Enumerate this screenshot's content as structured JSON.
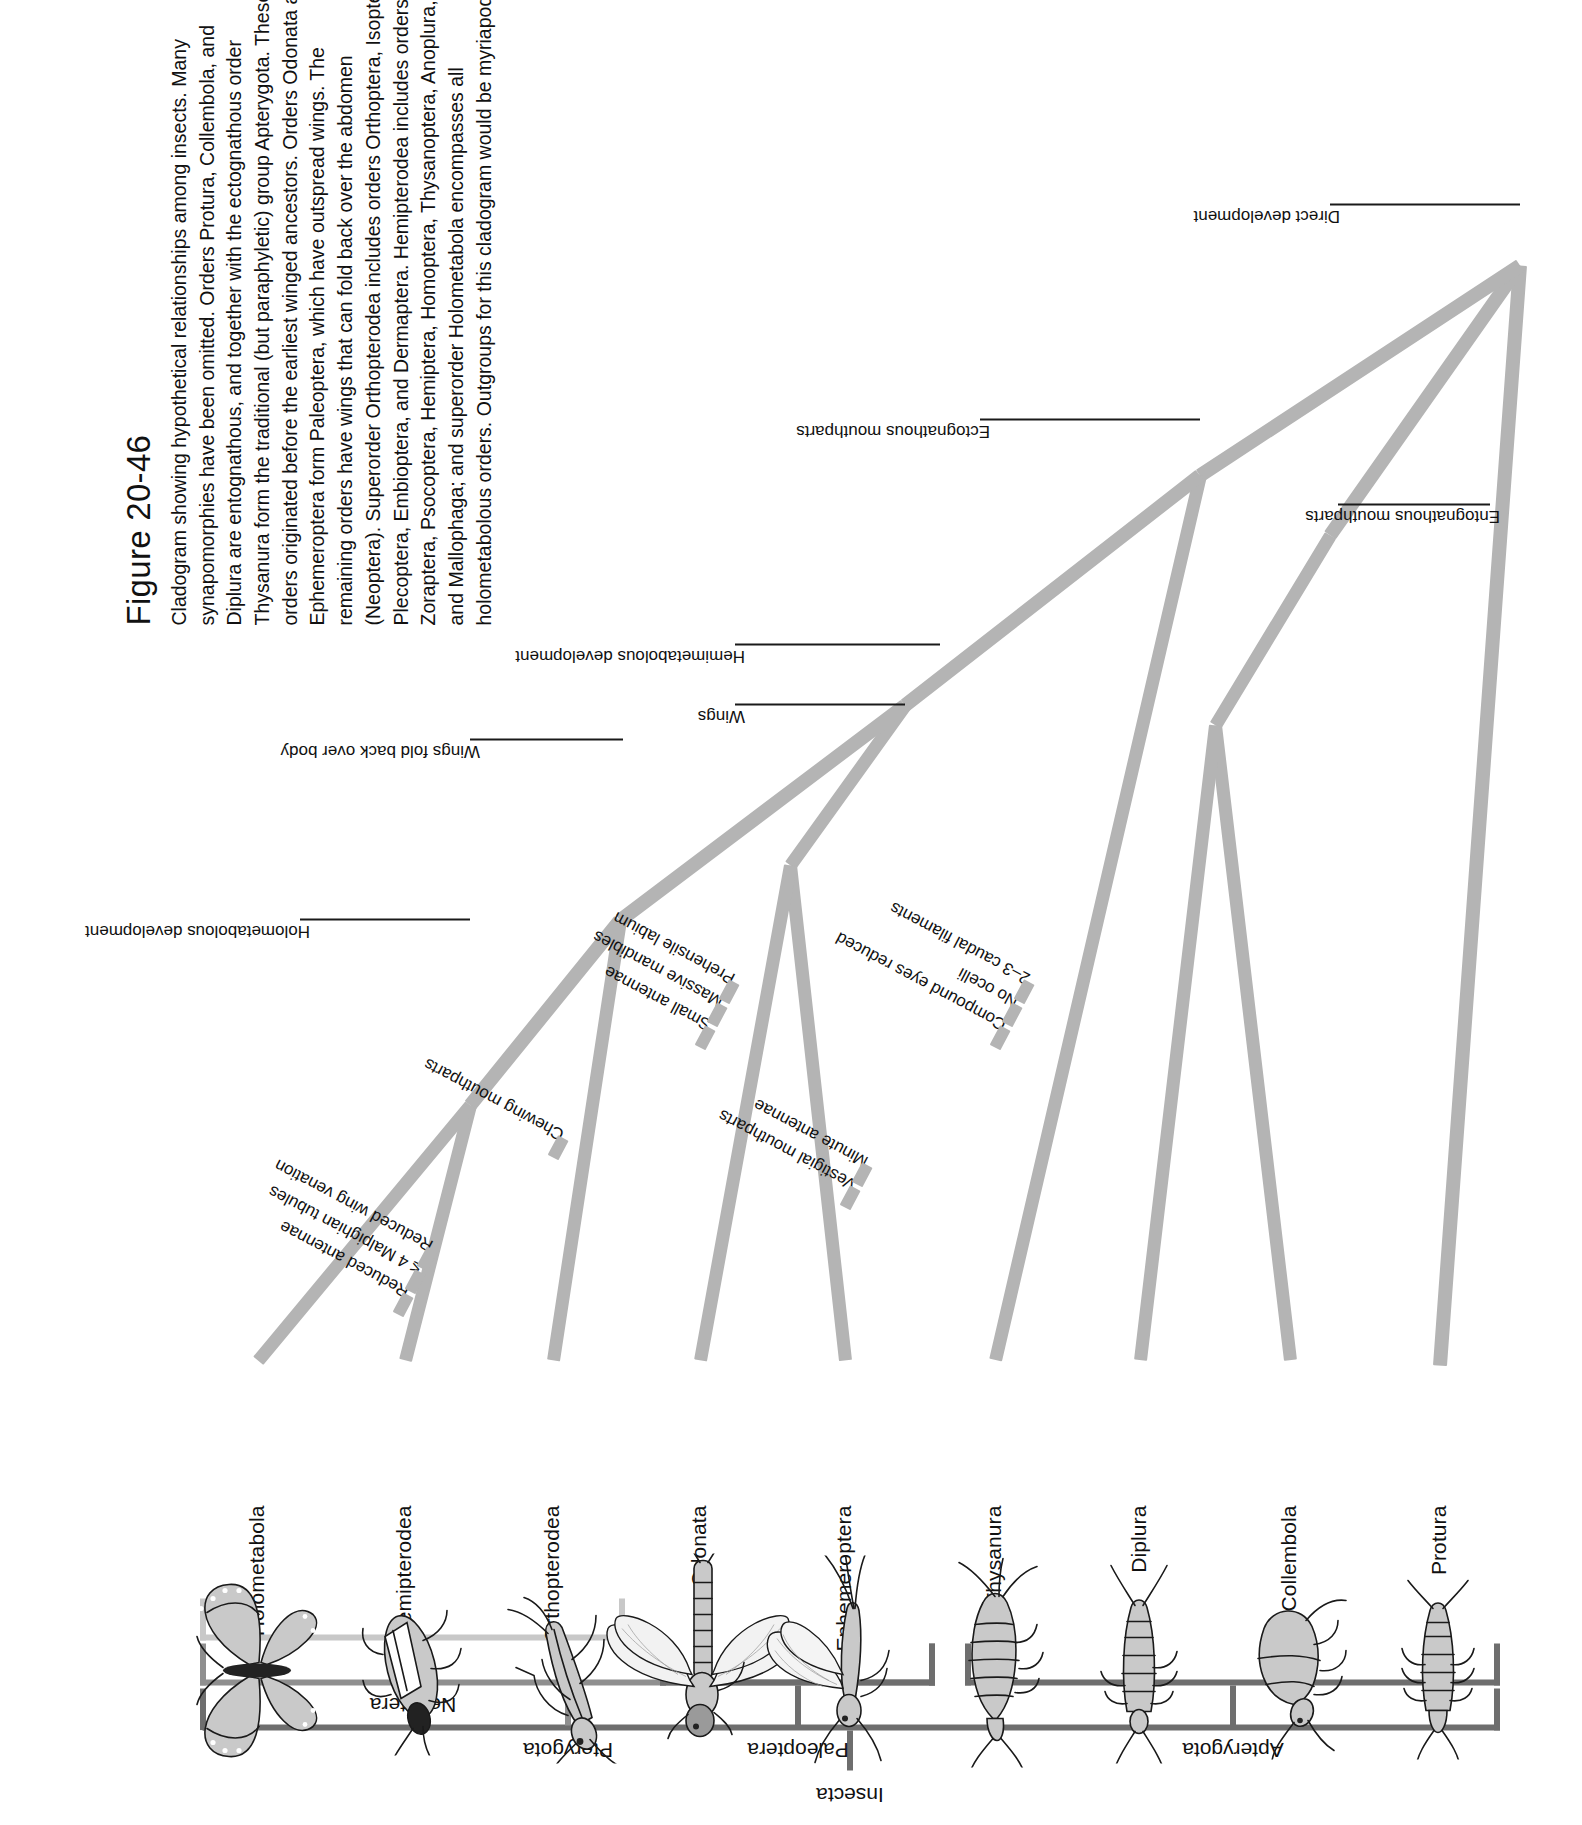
{
  "figure": {
    "number": "Figure 20-46",
    "caption": "Cladogram showing hypothetical relationships among insects. Many synapomorphies have been omitted. Orders Protura, Collembola, and Diplura are entognathous, and together with the ectognathous order Thysanura form the traditional (but paraphyletic) group Apterygota. These orders originated before the earliest winged ancestors. Orders Odonata and Ephemeroptera form Paleoptera, which have outspread wings. The remaining orders have wings that can fold back over the abdomen (Neoptera). Superorder Orthopterodea includes orders Orthoptera, Isoptera, Plecoptera, Embioptera, and Dermaptera. Hemipterodea includes orders Zoraptera, Psocoptera, Hemiptera, Homoptera, Thysanoptera, Anoplura, and Mallophaga; and superorder Holometabola encompasses all holometabolous orders. Outgroups for this cladogram would be myriapods."
  },
  "colors": {
    "branch": "#b4b4b4",
    "bracket_dark": "#6e6e6e",
    "bracket_mid": "#8f8f8f",
    "bracket_light": "#c8c8c8",
    "text": "#111111"
  },
  "chart_data": {
    "type": "diagram",
    "taxa": [
      {
        "id": "protura",
        "label": "Protura",
        "icon": "protura-drawing"
      },
      {
        "id": "collembola",
        "label": "Collembola",
        "icon": "collembola-drawing"
      },
      {
        "id": "diplura",
        "label": "Diplura",
        "icon": "diplura-drawing"
      },
      {
        "id": "thysanura",
        "label": "Thysanura",
        "icon": "thysanura-drawing"
      },
      {
        "id": "ephemeroptera",
        "label": "Ephemeroptera",
        "icon": "mayfly-drawing"
      },
      {
        "id": "odonata",
        "label": "Odonata",
        "icon": "dragonfly-drawing"
      },
      {
        "id": "orthopterodea",
        "label": "Orthopterodea",
        "icon": "mantis-drawing"
      },
      {
        "id": "hemipterodea",
        "label": "Hemipterodea",
        "icon": "truebug-drawing"
      },
      {
        "id": "holometabola",
        "label": "Holometabola",
        "icon": "butterfly-drawing"
      }
    ],
    "clade_brackets": [
      {
        "id": "insecta",
        "label": "Insecta",
        "shade": "dark"
      },
      {
        "id": "pterygota",
        "label": "Pterygota",
        "shade": "mid"
      },
      {
        "id": "neoptera",
        "label": "Neoptera",
        "shade": "light"
      },
      {
        "id": "paleoptera",
        "label": "Paleoptera",
        "shade": "dark"
      },
      {
        "id": "apterygota",
        "label": "Apterygota",
        "shade": "dark"
      }
    ],
    "synapomorphy_stacks": [
      {
        "id": "hemipterodea-chars",
        "items": [
          "Reduced antennae",
          "≤ 4 Malpighian tubules",
          "Reduced wing venation"
        ]
      },
      {
        "id": "orthopterodea-chars",
        "items": [
          "Chewing mouthparts"
        ]
      },
      {
        "id": "odonata-chars",
        "items": [
          "Small antennae",
          "Massive mandibles",
          "Prehensile labium"
        ]
      },
      {
        "id": "ephemeroptera-chars",
        "items": [
          "Vestigial mouthparts",
          "Minute antennae"
        ]
      },
      {
        "id": "thysanura-chars",
        "items": [
          "Compound eyes reduced",
          "No ocelli",
          "2–3 caudal filaments"
        ]
      }
    ],
    "node_callouts": [
      {
        "id": "holometabolous-development",
        "label": "Holometabolous development"
      },
      {
        "id": "wings-fold-back",
        "label": "Wings fold back over body"
      },
      {
        "id": "wings",
        "label": "Wings"
      },
      {
        "id": "hemimetabolous-development",
        "label": "Hemimetabolous development"
      },
      {
        "id": "ectognathous-mouthparts",
        "label": "Ectognathous mouthparts"
      },
      {
        "id": "entognathous-mouthparts",
        "label": "Entognathous mouthparts"
      },
      {
        "id": "direct-development",
        "label": "Direct development"
      }
    ]
  }
}
